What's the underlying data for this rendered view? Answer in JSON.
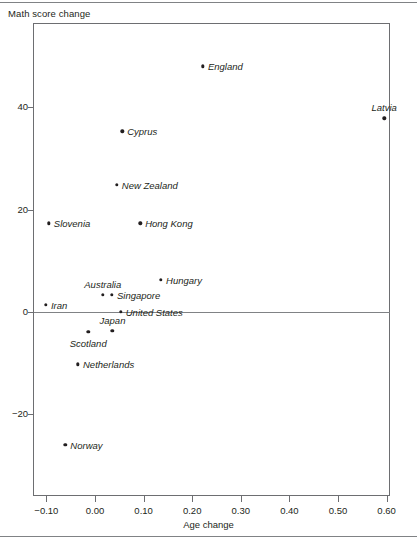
{
  "chart_data": {
    "type": "scatter",
    "title": "",
    "xlabel": "Age change",
    "ylabel": "Math score change",
    "xlim": [
      -0.135,
      0.6375
    ],
    "ylim": [
      -28.5,
      56.5
    ],
    "xticks": [
      "-0.10",
      "0.00",
      "0.10",
      "0.20",
      "0.30",
      "0.40",
      "0.50",
      "0.60"
    ],
    "xtick_values": [
      -0.1,
      0.0,
      0.1,
      0.2,
      0.3,
      0.4,
      0.5,
      0.6
    ],
    "yticks": [
      "40",
      "20",
      "0",
      "-20"
    ],
    "ytick_values": [
      40,
      20,
      0,
      -20
    ],
    "grid": false,
    "legend": "none",
    "zero_line": true,
    "points": [
      {
        "label": "England",
        "x": 0.222,
        "y": 48.0,
        "label_pos": "right"
      },
      {
        "label": "Latvia",
        "x": 0.595,
        "y": 37.8,
        "label_pos": "above"
      },
      {
        "label": "Cyprus",
        "x": 0.056,
        "y": 35.3,
        "label_pos": "right"
      },
      {
        "label": "New Zealand",
        "x": 0.045,
        "y": 24.9,
        "label_pos": "right"
      },
      {
        "label": "Slovenia",
        "x": -0.095,
        "y": 17.3,
        "label_pos": "right"
      },
      {
        "label": "Hong Kong",
        "x": 0.093,
        "y": 17.3,
        "label_pos": "right"
      },
      {
        "label": "Hungary",
        "x": 0.136,
        "y": 6.3,
        "label_pos": "right"
      },
      {
        "label": "Australia",
        "x": 0.016,
        "y": 3.3,
        "label_pos": "above"
      },
      {
        "label": "Singapore",
        "x": 0.035,
        "y": 3.3,
        "label_pos": "right"
      },
      {
        "label": "Iran",
        "x": -0.101,
        "y": 1.4,
        "label_pos": "right"
      },
      {
        "label": "United States",
        "x": 0.053,
        "y": 0.0,
        "label_pos": "right"
      },
      {
        "label": "Japan",
        "x": 0.036,
        "y": -3.7,
        "label_pos": "above"
      },
      {
        "label": "Scotland",
        "x": -0.014,
        "y": -3.9,
        "label_pos": "below"
      },
      {
        "label": "Netherlands",
        "x": -0.035,
        "y": -10.2,
        "label_pos": "right"
      },
      {
        "label": "Norway",
        "x": -0.061,
        "y": -25.9,
        "label_pos": "right"
      }
    ]
  }
}
